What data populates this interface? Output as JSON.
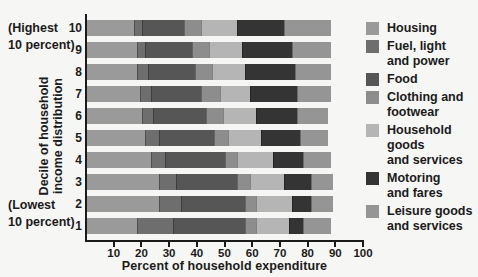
{
  "figure": {
    "background": "#f6f6f4",
    "text_color": "#1b1b1b"
  },
  "left_annotations": {
    "highest_line1": "(Highest",
    "highest_line2": "10 percent)",
    "lowest_line1": "(Lowest",
    "lowest_line2": "10 percent)"
  },
  "y_axis": {
    "title_line1": "Decile of household",
    "title_line2": "income distribution"
  },
  "x_axis": {
    "title": "Percent of household expenditure"
  },
  "legend": {
    "items": [
      {
        "name": "housing",
        "color": "#9a9a9a",
        "lines": [
          "Housing"
        ]
      },
      {
        "name": "fuel-light-and-power",
        "color": "#6e6e6e",
        "lines": [
          "Fuel, light",
          "and power"
        ]
      },
      {
        "name": "food",
        "color": "#565656",
        "lines": [
          "Food"
        ]
      },
      {
        "name": "clothing-and-footwear",
        "color": "#8d8d8d",
        "lines": [
          "Clothing and",
          "footwear"
        ]
      },
      {
        "name": "household-goods-and-services",
        "color": "#b5b5b5",
        "lines": [
          "Household goods",
          "and services"
        ]
      },
      {
        "name": "motoring-and-fares",
        "color": "#343434",
        "lines": [
          "Motoring",
          "and fares"
        ]
      },
      {
        "name": "leisure-goods-and-services",
        "color": "#959595",
        "lines": [
          "Leisure goods",
          "and services"
        ]
      }
    ]
  },
  "chart_data": {
    "type": "bar",
    "orientation": "horizontal-stacked",
    "title": "",
    "xlabel": "Percent of household expenditure",
    "ylabel": "Decile of household income distribution",
    "xlim": [
      0,
      100
    ],
    "xticks": [
      10,
      20,
      30,
      40,
      50,
      60,
      70,
      80,
      90,
      100
    ],
    "grid": false,
    "legend_position": "right",
    "categories": [
      "10",
      "9",
      "8",
      "7",
      "6",
      "5",
      "4",
      "3",
      "2",
      "1"
    ],
    "series": [
      {
        "name": "Housing",
        "color": "#9a9a9a",
        "values": [
          17,
          18,
          18,
          19,
          20,
          21,
          23,
          26,
          26,
          18
        ]
      },
      {
        "name": "Fuel, light and power",
        "color": "#6e6e6e",
        "values": [
          3,
          3,
          4,
          4,
          4,
          5,
          5,
          6,
          8,
          13
        ]
      },
      {
        "name": "Food",
        "color": "#565656",
        "values": [
          15,
          17,
          17,
          18,
          19,
          20,
          22,
          22,
          23,
          26
        ]
      },
      {
        "name": "Clothing and footwear",
        "color": "#8d8d8d",
        "values": [
          6,
          6,
          6,
          7,
          6,
          5,
          4,
          5,
          4,
          4
        ]
      },
      {
        "name": "Household goods and services",
        "color": "#b5b5b5",
        "values": [
          13,
          12,
          12,
          11,
          12,
          12,
          13,
          12,
          13,
          12
        ]
      },
      {
        "name": "Motoring and fares",
        "color": "#343434",
        "values": [
          17,
          18,
          18,
          17,
          15,
          14,
          11,
          10,
          7,
          5
        ]
      },
      {
        "name": "Leisure goods and services",
        "color": "#959595",
        "values": [
          17,
          14,
          13,
          12,
          11,
          10,
          10,
          8,
          8,
          10
        ]
      }
    ]
  }
}
